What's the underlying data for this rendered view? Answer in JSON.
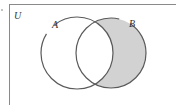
{
  "diagram": {
    "type": "venn",
    "universe_label": "U",
    "sets": [
      {
        "label": "A",
        "cx": 77,
        "cy": 53,
        "r": 36
      },
      {
        "label": "B",
        "cx": 111,
        "cy": 53,
        "r": 35
      }
    ],
    "shaded_region": "B minus A",
    "colors": {
      "stroke": "#5a5a5a",
      "shade": "#d2d2d2",
      "frame": "#8a8a8a",
      "background": "#ffffff"
    }
  }
}
